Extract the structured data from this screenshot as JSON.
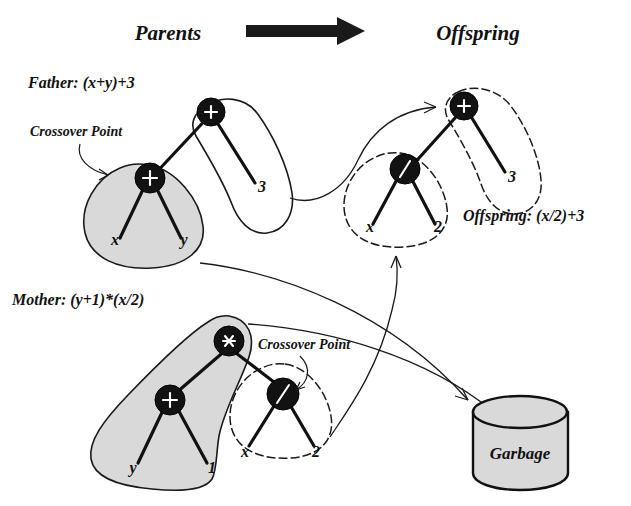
{
  "header": {
    "parents_label": "Parents",
    "offspring_label": "Offspring",
    "arrow_icon": "thick-right-arrow-icon"
  },
  "father": {
    "title": "Father: (x+y)+3",
    "crossover_label": "Crossover Point",
    "root_node": "+",
    "crossover_node": "+",
    "leaves": [
      "x",
      "y",
      "3"
    ]
  },
  "mother": {
    "title": "Mother: (y+1)*(x/2)",
    "crossover_label": "Crossover Point",
    "root_node": "*",
    "left_node": "+",
    "crossover_node": "/",
    "leaves": [
      "y",
      "1",
      "x",
      "2"
    ]
  },
  "offspring": {
    "title": "Offspring: (x/2)+3",
    "root_node": "+",
    "sub_node": "/",
    "leaves": [
      "x",
      "2",
      "3"
    ]
  },
  "garbage": {
    "label": "Garbage"
  },
  "colors": {
    "ink": "#1a1a1a",
    "node_fill": "#121212",
    "highlight_fill": "#d9d9d9",
    "background": "#ffffff"
  }
}
